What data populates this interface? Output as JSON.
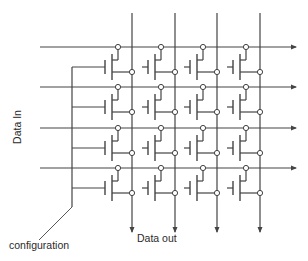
{
  "diagram": {
    "labels": {
      "data_in": "Data In",
      "data_out": "Data out",
      "configuration": "configuration"
    },
    "colors": {
      "line": "#444444",
      "node_fill": "#ffffff",
      "background": "#ffffff"
    },
    "grid": {
      "rows": 4,
      "columns": 4,
      "row_y": [
        47,
        87,
        128,
        168
      ],
      "column_x": [
        132,
        175,
        217,
        260
      ],
      "row_line_x_start": 40,
      "row_line_x_end": 296,
      "column_line_y_start": 13,
      "column_line_y_end": 232
    },
    "cell": {
      "type": "pass-transistor",
      "top_node_dx": -14,
      "channel_dx": -20,
      "gate_dx": -27,
      "gate_stub_dx": -33,
      "drain_dy": 13,
      "channel_top_dy": 7,
      "channel_bottom_dy": 33,
      "gate_top_dy": 13,
      "gate_bottom_dy": 27,
      "gate_mid_dy": 20,
      "source_dy": 25,
      "node_radius": 2.6
    },
    "configuration_bus": {
      "x": 72,
      "y_top": 67,
      "y_bottom": 207,
      "leader_end": [
        39,
        240
      ]
    }
  }
}
